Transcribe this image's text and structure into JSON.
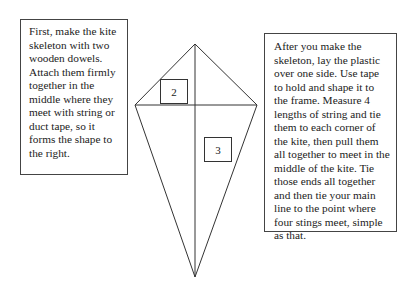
{
  "left_note": "First, make the kite skeleton with two wooden dowels. Attach them firmly together in the middle where they meet with string or duct tape, so it forms the shape to the right.",
  "right_note": "After you make the skeleton, lay the plastic over one side. Use tape to hold and shape it to the frame. Measure 4 lengths of string and tie them to each corner of the kite, then pull them all together to meet in the middle of the kite. Tie those ends all together and then tie your main line to the point where four stings meet, simple as that.",
  "kite": {
    "labels": [
      "2",
      "3"
    ]
  }
}
